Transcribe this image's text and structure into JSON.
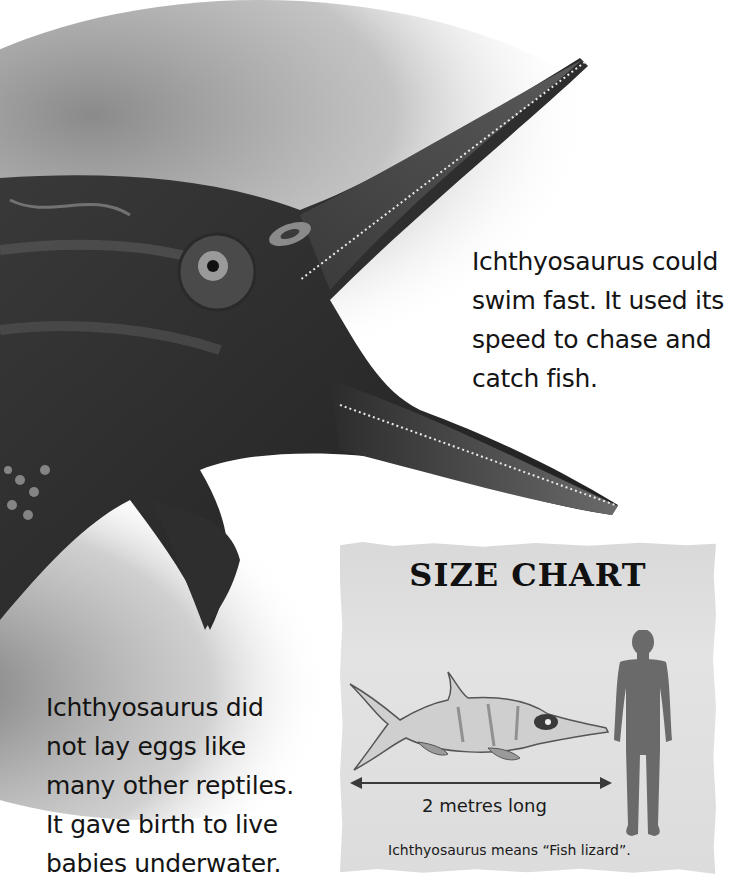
{
  "page": {
    "subject": "Ichthyosaurus",
    "paragraphs": {
      "top": [
        "Ichthyosaurus could",
        "swim fast. It used its",
        "speed to chase and",
        "catch fish."
      ],
      "bottom": [
        "Ichthyosaurus did",
        "not lay eggs like",
        "many other reptiles.",
        "It gave birth to live",
        "babies underwater."
      ]
    },
    "size_chart": {
      "title": "SIZE CHART",
      "measurement": "2 metres long",
      "caption": "Ichthyosaurus means “Fish lizard”."
    },
    "colors": {
      "background": "#ffffff",
      "text": "#141414",
      "chart_panel": "#dedede",
      "silhouette": "#6a6a6a"
    }
  }
}
